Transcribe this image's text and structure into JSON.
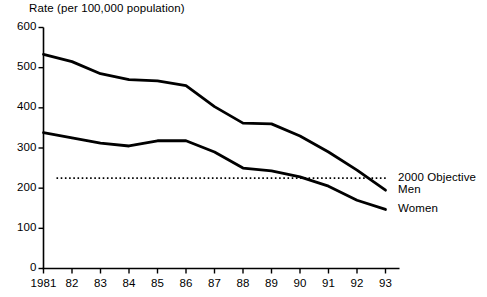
{
  "chart_data": {
    "type": "line",
    "title": "Rate (per 100,000 population)",
    "xlabel": "",
    "ylabel": "Rate (per 100,000 population)",
    "ylim": [
      0,
      600
    ],
    "ytick_values": [
      0,
      100,
      200,
      300,
      400,
      500,
      600
    ],
    "ytick_labels": [
      "0",
      "100",
      "200",
      "300",
      "400",
      "500",
      "600"
    ],
    "grid": false,
    "legend_position": "right-inline-annotations",
    "categories": [
      "1981",
      "82",
      "83",
      "84",
      "85",
      "86",
      "87",
      "88",
      "89",
      "90",
      "91",
      "92",
      "93"
    ],
    "x": [
      1981,
      1982,
      1983,
      1984,
      1985,
      1986,
      1987,
      1988,
      1989,
      1990,
      1991,
      1992,
      1993
    ],
    "series": [
      {
        "name": "Men",
        "style": "solid",
        "color": "#000000",
        "values": [
          533,
          515,
          485,
          470,
          467,
          455,
          403,
          362,
          360,
          330,
          290,
          245,
          195
        ]
      },
      {
        "name": "Women",
        "style": "solid",
        "color": "#000000",
        "values": [
          338,
          325,
          312,
          305,
          318,
          318,
          290,
          250,
          243,
          228,
          205,
          170,
          147
        ]
      },
      {
        "name": "2000 Objective",
        "style": "dotted",
        "color": "#000000",
        "constant_value": 225,
        "values": [
          225,
          225,
          225,
          225,
          225,
          225,
          225,
          225,
          225,
          225,
          225,
          225,
          225
        ]
      }
    ],
    "annotations": [
      {
        "text": "2000 Objective",
        "series": "2000 Objective",
        "value": 225
      },
      {
        "text": "Men",
        "series": "Men",
        "value": 195
      },
      {
        "text": "Women",
        "series": "Women",
        "value": 147
      }
    ]
  }
}
